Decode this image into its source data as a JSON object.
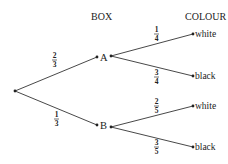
{
  "headers": {
    "box": "BOX",
    "colour": "COLOUR"
  },
  "root": {
    "x": 15,
    "y": 91
  },
  "nodes": {
    "A": {
      "label": "A",
      "x": 98,
      "y": 57
    },
    "B": {
      "label": "B",
      "x": 98,
      "y": 125
    }
  },
  "leaves": [
    {
      "label": "white",
      "x": 193,
      "y": 34
    },
    {
      "label": "black",
      "x": 193,
      "y": 76
    },
    {
      "label": "white",
      "x": 193,
      "y": 106
    },
    {
      "label": "black",
      "x": 193,
      "y": 147
    }
  ],
  "edges": {
    "root_A": {
      "num": "2",
      "den": "3"
    },
    "root_B": {
      "num": "1",
      "den": "3"
    },
    "A_white": {
      "num": "1",
      "den": "4"
    },
    "A_black": {
      "num": "3",
      "den": "4"
    },
    "B_white": {
      "num": "2",
      "den": "5"
    },
    "B_black": {
      "num": "3",
      "den": "5"
    }
  }
}
